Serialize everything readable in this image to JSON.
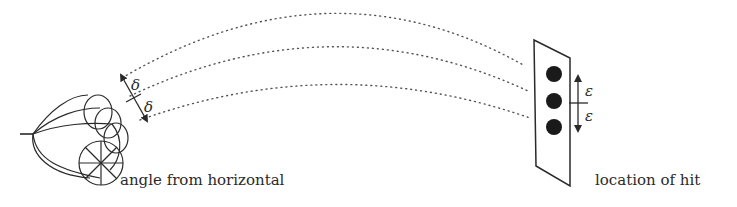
{
  "diagram": {
    "labels": {
      "left": "angle from horizontal",
      "right": "location of hit"
    },
    "symbols": {
      "delta_upper": "δ",
      "delta_lower": "δ",
      "epsilon_upper": "ε",
      "epsilon_lower": "ε"
    },
    "elements": {
      "launcher": "cannon / thrower with cone of launch angles",
      "trajectories": 3,
      "target_panel": "parallelogram target board",
      "hit_points": 3
    },
    "colors": {
      "ink": "#2a2a2a",
      "dots": "#1a1a1a",
      "background": "#ffffff"
    }
  }
}
